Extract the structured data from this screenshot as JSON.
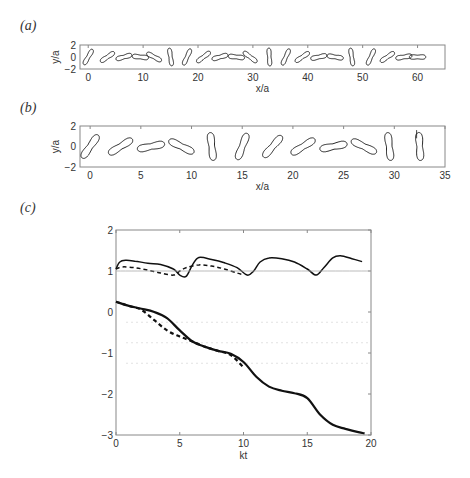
{
  "panels": {
    "a": {
      "label": "(a)",
      "xlabel": "x/a",
      "ylabel": "y/a",
      "xticks": [
        "0",
        "10",
        "20",
        "30",
        "40",
        "50",
        "60"
      ],
      "yticks": [
        "2",
        "0",
        "−2"
      ]
    },
    "b": {
      "label": "(b)",
      "xlabel": "x/a",
      "ylabel": "y/a",
      "xticks": [
        "0",
        "5",
        "10",
        "15",
        "20",
        "25",
        "30",
        "35"
      ],
      "yticks": [
        "2",
        "0",
        "−2"
      ]
    },
    "c": {
      "label": "(c)",
      "xlabel": "kt",
      "ylabel": "",
      "xticks": [
        "0",
        "5",
        "10",
        "15",
        "20"
      ],
      "yticks": [
        "2",
        "1",
        "0",
        "−1",
        "−2",
        "−3"
      ]
    }
  },
  "colors": {
    "line": "#111111",
    "axis": "#888888",
    "reference": "#aaaaaa"
  },
  "chart_data": [
    {
      "type": "scatter",
      "title": "(a) Snapshots of dumbbell-shaped particle translating along x",
      "xlabel": "x/a",
      "ylabel": "y/a",
      "xlim": [
        -1.5,
        65
      ],
      "ylim": [
        -2,
        2
      ],
      "shape_centers_x": [
        0,
        3.5,
        6.5,
        9.5,
        12,
        15,
        18,
        21,
        24,
        27,
        29.5,
        33,
        36,
        39,
        42,
        45,
        48,
        51.5,
        54.5,
        57.5,
        60
      ]
    },
    {
      "type": "scatter",
      "title": "(b) Snapshots of dumbbell-shaped particle (zoomed)",
      "xlabel": "x/a",
      "ylabel": "y/a",
      "xlim": [
        -1,
        35
      ],
      "ylim": [
        -2,
        2
      ],
      "shape_centers_x": [
        0,
        3,
        6,
        9,
        12,
        15,
        18,
        21,
        24,
        27,
        29.5,
        32.5
      ]
    },
    {
      "type": "line",
      "title": "(c)",
      "xlabel": "kt",
      "ylabel": "",
      "xlim": [
        0,
        20
      ],
      "ylim": [
        -3,
        2
      ],
      "grid": false,
      "series": [
        {
          "name": "upper solid",
          "style": "solid",
          "x": [
            0,
            0.3,
            0.8,
            1.5,
            2.5,
            3.5,
            4.5,
            5.0,
            5.5,
            6.0,
            6.5,
            7.5,
            8.5,
            9.5,
            10.3,
            10.8,
            11.3,
            12,
            13,
            14,
            15,
            15.7,
            16.3,
            17,
            17.6,
            18.5,
            19.3
          ],
          "y": [
            1.05,
            1.22,
            1.26,
            1.24,
            1.19,
            1.16,
            1.05,
            0.9,
            0.87,
            1.15,
            1.33,
            1.28,
            1.2,
            1.08,
            0.9,
            1.0,
            1.22,
            1.32,
            1.3,
            1.22,
            1.05,
            0.9,
            1.08,
            1.32,
            1.37,
            1.3,
            1.23
          ]
        },
        {
          "name": "upper dashed",
          "style": "dashed",
          "x": [
            0,
            0.5,
            1.5,
            2.5,
            3.5,
            4.5,
            5.0,
            5.5,
            6.5,
            7.5,
            8.5,
            9.5,
            10.0
          ],
          "y": [
            1.05,
            1.1,
            1.08,
            1.02,
            0.95,
            0.9,
            1.0,
            1.08,
            1.15,
            1.12,
            1.05,
            0.95,
            0.91
          ]
        },
        {
          "name": "reference y=1",
          "style": "thin",
          "x": [
            0,
            20
          ],
          "y": [
            1.0,
            1.0
          ]
        },
        {
          "name": "lower solid",
          "style": "solid-thick",
          "x": [
            0,
            1,
            2,
            3,
            4,
            5,
            6,
            7,
            8,
            9,
            10,
            11,
            12,
            13,
            14,
            15,
            16,
            17,
            18,
            19,
            19.5
          ],
          "y": [
            0.25,
            0.15,
            0.08,
            0.0,
            -0.15,
            -0.45,
            -0.72,
            -0.85,
            -0.95,
            -1.02,
            -1.22,
            -1.58,
            -1.82,
            -1.92,
            -1.98,
            -2.1,
            -2.5,
            -2.75,
            -2.85,
            -2.93,
            -2.96
          ]
        },
        {
          "name": "lower dashed",
          "style": "dashed-thick",
          "x": [
            0,
            1,
            2,
            3,
            4,
            5,
            6,
            7,
            8,
            9,
            10
          ],
          "y": [
            0.25,
            0.15,
            0.05,
            -0.2,
            -0.45,
            -0.6,
            -0.72,
            -0.85,
            -0.95,
            -1.05,
            -1.35
          ]
        }
      ]
    }
  ]
}
